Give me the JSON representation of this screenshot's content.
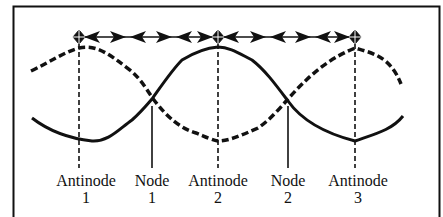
{
  "diagram": {
    "colors": {
      "ink": "#111111",
      "background": "#ffffff"
    },
    "labels": [
      {
        "id": "antinode-1",
        "line1": "Antinode",
        "line2": "1",
        "x": 79,
        "kind": "antinode"
      },
      {
        "id": "node-1",
        "line1": "Node",
        "line2": "1",
        "x": 152,
        "kind": "node"
      },
      {
        "id": "antinode-2",
        "line1": "Antinode",
        "line2": "2",
        "x": 218,
        "kind": "antinode"
      },
      {
        "id": "node-2",
        "line1": "Node",
        "line2": "2",
        "x": 288,
        "kind": "node"
      },
      {
        "id": "antinode-3",
        "line1": "Antinode",
        "line2": "3",
        "x": 355,
        "kind": "antinode"
      }
    ],
    "waves": [
      {
        "name": "dashed-wave",
        "style": "dashed",
        "description": "wave at one extreme"
      },
      {
        "name": "solid-wave",
        "style": "solid",
        "description": "wave at opposite extreme"
      }
    ],
    "arrow_row": {
      "description": "arrows between antinodes indicating spacing (half wavelength)"
    }
  }
}
